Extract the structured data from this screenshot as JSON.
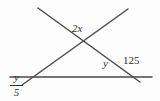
{
  "diagram": {
    "canvas": {
      "width": 160,
      "height": 101
    },
    "background_color": "#fdfdfd",
    "stroke_color": "#4a4a4a",
    "stroke_width": 1.5,
    "text_color": "#2e2e2e",
    "lines": [
      {
        "name": "horizontal-line",
        "x1": 10,
        "y1": 77,
        "x2": 152,
        "y2": 77
      },
      {
        "name": "descending-transversal",
        "x1": 38,
        "y1": 8,
        "x2": 140,
        "y2": 82
      },
      {
        "name": "ascending-transversal",
        "x1": 22,
        "y1": 85,
        "x2": 128,
        "y2": 9
      }
    ],
    "vertices": [
      {
        "name": "apex-intersection",
        "x": 82,
        "y": 42
      },
      {
        "name": "left-base-intersection",
        "x": 30,
        "y": 77
      },
      {
        "name": "right-base-intersection",
        "x": 130,
        "y": 76
      }
    ],
    "labels": {
      "apex_angle": "2x",
      "interior_angle": "y",
      "exterior_angle": "125",
      "fraction_numerator": "y",
      "fraction_denominator": "5"
    }
  }
}
